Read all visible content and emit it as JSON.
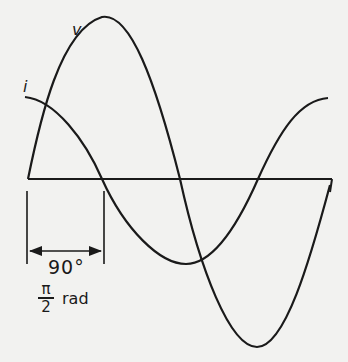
{
  "diagram": {
    "title": "",
    "curves": [
      {
        "name": "v",
        "label": "v",
        "type": "sine",
        "phase_deg": 0,
        "amplitude_px": 162
      },
      {
        "name": "i",
        "label": "i",
        "type": "sine",
        "phase_deg": 90,
        "amplitude_px": 85
      }
    ],
    "labels": {
      "voltage": "v",
      "current": "i",
      "phase_degrees": "90°",
      "phase_rad_numerator": "π",
      "phase_rad_denominator": "2",
      "phase_rad_unit": "rad"
    },
    "colors": {
      "background": "#f2f2f0",
      "stroke": "#1a1a1a"
    }
  }
}
